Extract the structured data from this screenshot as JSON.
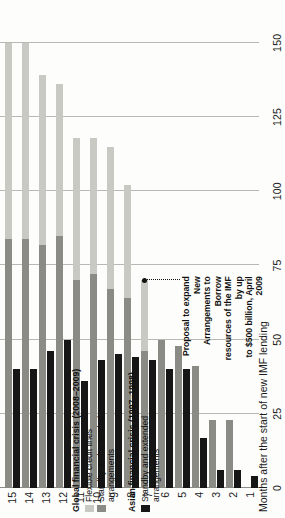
{
  "chart_data": {
    "type": "bar",
    "orientation": "horizontal-rotated",
    "title": "",
    "xlabel": "Months after the start of new IMF lending",
    "ylabel": "",
    "value_axis_ticks": [
      0,
      25,
      50,
      75,
      100,
      125,
      150
    ],
    "value_axis_range": [
      0,
      155
    ],
    "categories": [
      "1",
      "2",
      "3",
      "4",
      "5",
      "6",
      "7",
      "8",
      "9",
      "10",
      "11",
      "12",
      "13",
      "14",
      "15"
    ],
    "grid": true,
    "legend_position": "left",
    "series": [
      {
        "name": "Flexible credit lines",
        "color": "#c9c9c4",
        "crisis": "Global financial crisis (2008-2009)",
        "values": [
          0,
          0,
          0,
          0,
          0,
          0,
          70,
          102,
          115,
          118,
          118,
          136,
          139,
          150,
          150
        ]
      },
      {
        "name": "Standby and extended arrangements",
        "color": "#8b8b86",
        "crisis": "Global financial crisis (2008-2009)",
        "values": [
          0,
          23,
          23,
          41,
          48,
          50,
          46,
          64,
          67,
          72,
          70,
          85,
          82,
          84,
          84
        ]
      },
      {
        "name": "Standby and extended arrangements",
        "color": "#161616",
        "crisis": "Asian financial crisis (1997-1998)",
        "values": [
          4,
          6,
          6,
          17,
          40,
          40,
          43,
          44,
          45,
          43,
          36,
          50,
          46,
          40,
          40
        ]
      }
    ],
    "annotation": {
      "text": "Proposal to expand New\nArrangements to Borrow\nresources of the IMF by up\nto $500 billion, April 2009",
      "point_category": "7",
      "point_value": 70
    }
  },
  "legend": {
    "groups": [
      {
        "title": "Global financial crisis (2008–2009)",
        "entries": [
          {
            "swatch": "fcl",
            "label": "Flexible credit lines"
          },
          {
            "swatch": "sba",
            "label": "Standby and extended\narrangements"
          }
        ]
      },
      {
        "title": "Asian financial crisis (1997–1998)",
        "entries": [
          {
            "swatch": "asia",
            "label": "Standby and extended\narrangements"
          }
        ]
      }
    ]
  },
  "axis": {
    "category_title": "Months after the start of new IMF lending",
    "tick_labels": [
      "0",
      "25",
      "50",
      "75",
      "100",
      "125",
      "150"
    ],
    "category_labels": [
      "1",
      "2",
      "3",
      "4",
      "5",
      "6",
      "7",
      "8",
      "9",
      "10",
      "11",
      "12",
      "13",
      "14",
      "15"
    ]
  },
  "annotation": {
    "line1": "Proposal to expand New",
    "line2": "Arrangements to Borrow",
    "line3": "resources of the IMF by up",
    "line4": "to $500 billion, April 2009",
    "full": "Proposal to expand New\nArrangements to Borrow\nresources of the IMF by up\nto $500 billion, April 2009"
  }
}
